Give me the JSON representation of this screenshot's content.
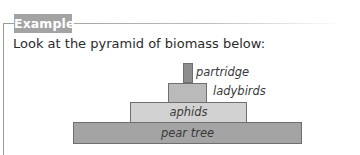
{
  "badge": {
    "label": "Example"
  },
  "intro": {
    "text": "Look at the pyramid of biomass below:"
  },
  "pyramid": {
    "title": "Pyramid of biomass",
    "levels": [
      {
        "label": "partridge",
        "label_position": "right",
        "fill": "#8e8e8e",
        "x": 183,
        "y": 63,
        "w": 10,
        "h": 20
      },
      {
        "label": "ladybirds",
        "label_position": "right",
        "fill": "#bababa",
        "x": 168,
        "y": 83,
        "w": 39,
        "h": 19
      },
      {
        "label": "aphids",
        "label_position": "inside",
        "fill": "#d2d2d2",
        "x": 130,
        "y": 102,
        "w": 117,
        "h": 21
      },
      {
        "label": "pear tree",
        "label_position": "inside",
        "fill": "#a4a4a4",
        "x": 73,
        "y": 122,
        "w": 229,
        "h": 22
      }
    ]
  },
  "colors": {
    "badge_bg": "#a3a3a3",
    "frame": "#9a9a9a"
  }
}
